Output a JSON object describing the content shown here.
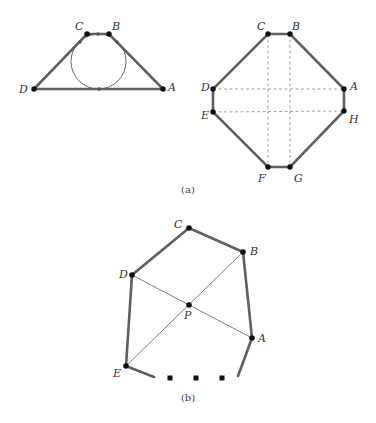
{
  "figure_a_left": {
    "type": "trapezoid-with-incircle",
    "vertices": {
      "C": {
        "x": 87,
        "y": 34,
        "label": "C"
      },
      "B": {
        "x": 109,
        "y": 34,
        "label": "B"
      },
      "A": {
        "x": 163,
        "y": 89,
        "label": "A"
      },
      "D": {
        "x": 34,
        "y": 89,
        "label": "D"
      }
    },
    "incircle": {
      "cx": 98.5,
      "cy": 61.5,
      "r": 27.5
    },
    "tangent_points": [
      {
        "x": 98,
        "y": 34
      },
      {
        "x": 99,
        "y": 89
      },
      {
        "x": 80,
        "y": 42
      },
      {
        "x": 117,
        "y": 42
      }
    ]
  },
  "figure_a_right": {
    "type": "octagon",
    "vertices": {
      "C": {
        "x": 268,
        "y": 34,
        "label": "C"
      },
      "B": {
        "x": 290,
        "y": 34,
        "label": "B"
      },
      "A": {
        "x": 344,
        "y": 89,
        "label": "A"
      },
      "H": {
        "x": 344,
        "y": 111,
        "label": "H"
      },
      "G": {
        "x": 290,
        "y": 167,
        "label": "G"
      },
      "F": {
        "x": 268,
        "y": 167,
        "label": "F"
      },
      "E": {
        "x": 213,
        "y": 112,
        "label": "E"
      },
      "D": {
        "x": 213,
        "y": 89,
        "label": "D"
      }
    },
    "dashed_lines": [
      "C-F",
      "B-G",
      "D-A",
      "E-H"
    ]
  },
  "caption_a": "(a)",
  "figure_b": {
    "type": "polygon-with-diagonals",
    "vertices": {
      "C": {
        "x": 189,
        "y": 228,
        "label": "C"
      },
      "B": {
        "x": 243,
        "y": 252,
        "label": "B"
      },
      "A": {
        "x": 252,
        "y": 338,
        "label": "A"
      },
      "D": {
        "x": 132,
        "y": 275,
        "label": "D"
      },
      "E": {
        "x": 126,
        "y": 366,
        "label": "E"
      },
      "P": {
        "x": 189,
        "y": 305,
        "label": "P"
      }
    },
    "diagonals": [
      "D-A",
      "E-B"
    ],
    "ellipsis": "..."
  },
  "caption_b": "(b)"
}
